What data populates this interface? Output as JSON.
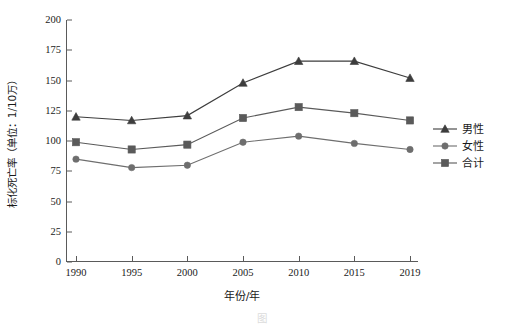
{
  "chart_data": {
    "type": "line",
    "title": "",
    "xlabel": "年份/年",
    "ylabel": "标化死亡率（单位：1/10万）",
    "categories": [
      "1990",
      "1995",
      "2000",
      "2005",
      "2010",
      "2015",
      "2019"
    ],
    "x": [
      1990,
      1995,
      2000,
      2005,
      2010,
      2015,
      2019
    ],
    "ylim": [
      0,
      200
    ],
    "xlim": [
      1990,
      2019
    ],
    "yticks": [
      "0",
      "25",
      "50",
      "75",
      "100",
      "125",
      "150",
      "175",
      "200"
    ],
    "ytick_values": [
      0,
      25,
      50,
      75,
      100,
      125,
      150,
      175,
      200
    ],
    "grid": false,
    "legend_position": "right",
    "series": [
      {
        "name": "男性",
        "marker": "triangle",
        "color": "#3d3d3d",
        "values": [
          120,
          117,
          121,
          148,
          166,
          166,
          152
        ]
      },
      {
        "name": "女性",
        "marker": "circle",
        "color": "#6e6e6e",
        "values": [
          85,
          78,
          80,
          99,
          104,
          98,
          93
        ]
      },
      {
        "name": "合计",
        "marker": "square",
        "color": "#5a5a5a",
        "values": [
          99,
          93,
          97,
          119,
          128,
          123,
          117
        ]
      }
    ]
  },
  "legend": {
    "items": [
      {
        "label": "男性",
        "marker": "triangle",
        "color": "#3d3d3d"
      },
      {
        "label": "女性",
        "marker": "circle",
        "color": "#6e6e6e"
      },
      {
        "label": "合计",
        "marker": "square",
        "color": "#5a5a5a"
      }
    ]
  },
  "caption": {
    "text": "图"
  },
  "colors": {
    "axis": "#5a5a5a",
    "male": "#3d3d3d",
    "female": "#6e6e6e",
    "total": "#5a5a5a",
    "background": "#ffffff"
  }
}
